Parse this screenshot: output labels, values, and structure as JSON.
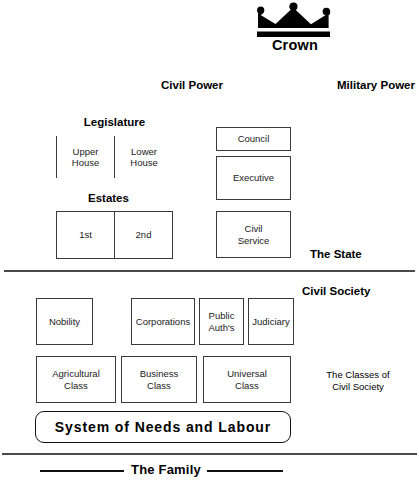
{
  "diagram": {
    "crown": {
      "icon": "crown-icon",
      "label": "Crown"
    },
    "power_headings": {
      "civil": "Civil Power",
      "military": "Military Power"
    },
    "section_labels": {
      "state": "The State",
      "civil_society": "Civil Society",
      "classes": "The Classes of\nCivil Society",
      "classes_line1": "The Classes of",
      "classes_line2": "Civil Society",
      "family": "The Family"
    },
    "civil_power": {
      "legislature": {
        "title": "Legislature",
        "children": [
          {
            "label": "Upper\nHouse",
            "line1": "Upper",
            "line2": "House"
          },
          {
            "label": "Lower\nHouse",
            "line1": "Lower",
            "line2": "House"
          }
        ]
      },
      "estates": {
        "title": "Estates",
        "children": [
          {
            "label": "1st"
          },
          {
            "label": "2nd"
          }
        ]
      }
    },
    "military_power": {
      "boxes": [
        {
          "label": "Council"
        },
        {
          "label": "Executive"
        },
        {
          "label": "Civil\nService",
          "line1": "Civil",
          "line2": "Service"
        }
      ]
    },
    "civil_society": {
      "institutions": [
        {
          "label": "Nobility"
        },
        {
          "label": "Corporations"
        },
        {
          "label": "Public\nAuth's",
          "line1": "Public",
          "line2": "Auth's"
        },
        {
          "label": "Judiciary"
        }
      ],
      "classes": [
        {
          "line1": "Agricultural",
          "line2": "Class"
        },
        {
          "line1": "Business",
          "line2": "Class"
        },
        {
          "line1": "Universal",
          "line2": "Class"
        }
      ],
      "base": {
        "label": "System of Needs and Labour"
      }
    },
    "colors": {
      "ink": "#000000",
      "box_border": "#3a3a3a",
      "separator": "#4a4a4a",
      "background": "#ffffff"
    }
  }
}
